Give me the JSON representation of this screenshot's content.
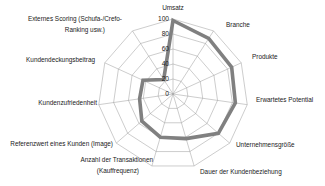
{
  "chart_data": {
    "type": "radar",
    "title": "",
    "subtitle": "",
    "xlabel": "",
    "ylabel": "",
    "grid": true,
    "legend_position": "none",
    "rlim": [
      0,
      100
    ],
    "r_ticks": [
      "100",
      "80",
      "60",
      "40",
      "20",
      "0"
    ],
    "r_tick_values": [
      100,
      80,
      60,
      40,
      20,
      0
    ],
    "ring_count": 5,
    "categories": [
      "Umsatz",
      "Branche",
      "Produkte",
      "Erwartetes Potential",
      "Unternehmensgröße",
      "Dauer der Kundenbeziehung",
      "Anzahl der Transaktionen (Kauffrequenz)",
      "Referenzwert eines Kunden (Image)",
      "Kundenzufriedenheit",
      "Kundendeckungsbeitrag",
      "Externes Scoring (Schufa-/Crefo-Ranking usw.)"
    ],
    "series": [
      {
        "name": "Kundenbewertung",
        "color": "#808080",
        "line_width": 3.6,
        "values": [
          98,
          88,
          86,
          84,
          80,
          62,
          60,
          55,
          45,
          44,
          23
        ]
      }
    ],
    "colors": {
      "series_line": "#808080",
      "grid": "#9a9a9a",
      "text": "#1a1a1a",
      "background": "#ffffff"
    },
    "category_labels": [
      {
        "text": "Umsatz",
        "x": 173,
        "y": 8,
        "anchor": "middle"
      },
      {
        "text": "Branche",
        "x": 226,
        "y": 25,
        "anchor": "start"
      },
      {
        "text": "Produkte",
        "x": 252,
        "y": 57,
        "anchor": "start"
      },
      {
        "text": "Erwartetes Potential",
        "x": 256,
        "y": 100,
        "anchor": "start"
      },
      {
        "text": "Unternehmensgröße",
        "x": 236,
        "y": 145,
        "anchor": "start"
      },
      {
        "text": "Dauer der Kundenbeziehung",
        "x": 200,
        "y": 172,
        "anchor": "start"
      },
      {
        "text": "Anzahl der Transaktionen",
        "x": 153,
        "y": 160,
        "anchor": "end"
      },
      {
        "text": "(Kauffrequenz)",
        "x": 139,
        "y": 171,
        "anchor": "end"
      },
      {
        "text": "Referenzwert eines Kunden (Image)",
        "x": 113,
        "y": 144,
        "anchor": "end"
      },
      {
        "text": "Kundenzufriedenheit",
        "x": 97,
        "y": 103,
        "anchor": "end"
      },
      {
        "text": "Kundendeckungsbeitrag",
        "x": 95,
        "y": 60,
        "anchor": "end"
      },
      {
        "text": "Externes Scoring (Schufa-/Crefo-",
        "x": 122,
        "y": 19,
        "anchor": "end"
      },
      {
        "text": "Ranking usw.)",
        "x": 105,
        "y": 30,
        "anchor": "end"
      }
    ]
  }
}
